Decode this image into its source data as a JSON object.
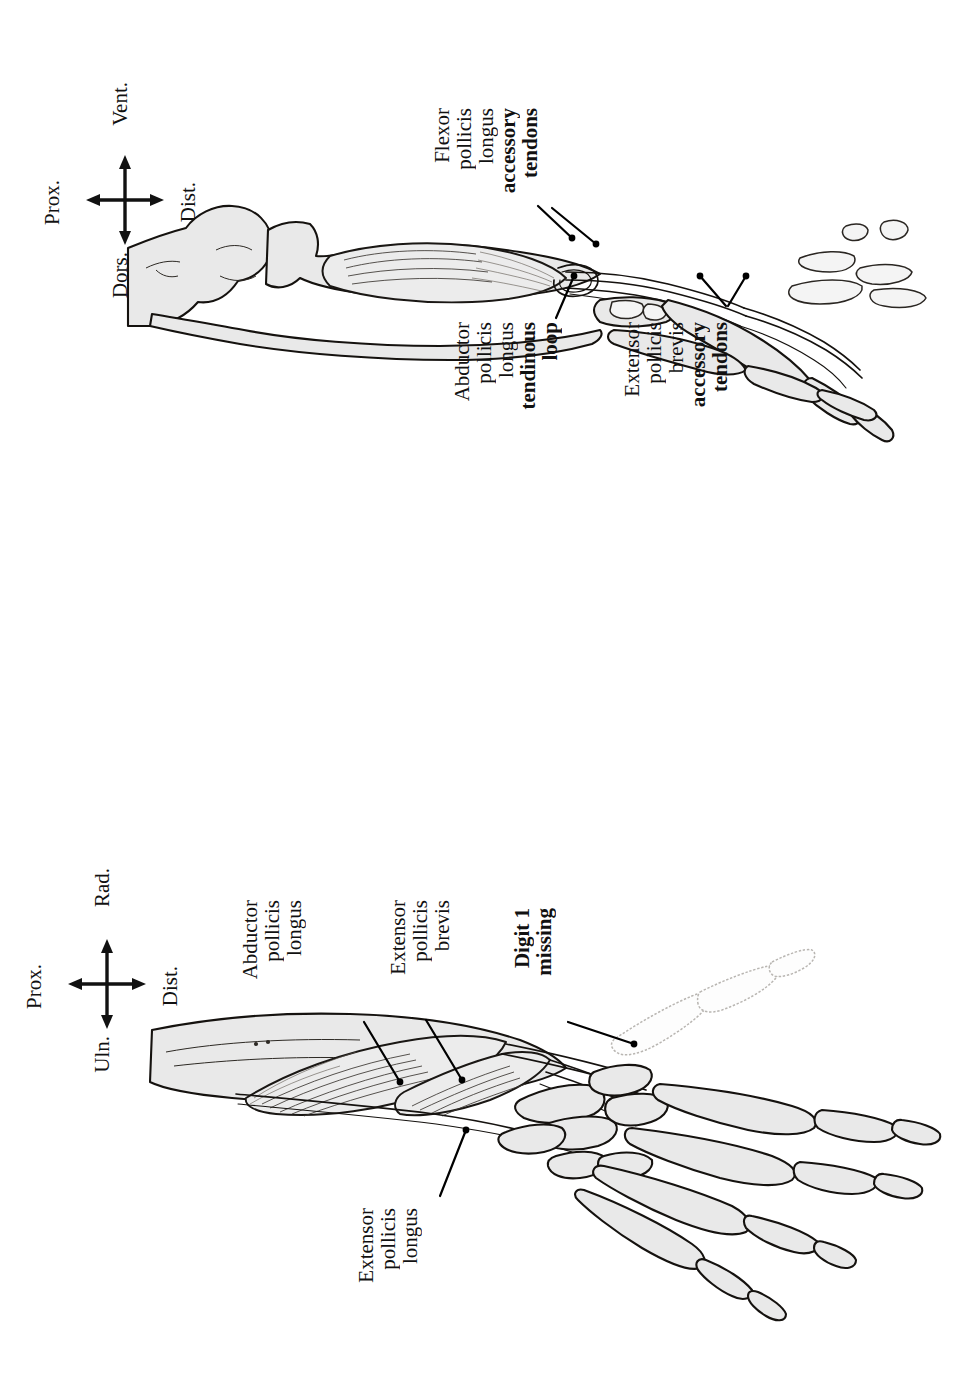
{
  "figure": {
    "type": "anatomical-line-drawing",
    "panels": [
      {
        "id": "ventral-view",
        "view_name": "ventral",
        "orientation_compass": {
          "up_label": "Vent.",
          "down_label": "Dors.",
          "left_label": "Prox.",
          "right_label": "Dist."
        },
        "labels": [
          {
            "id": "flexor-pollicis-longus-accessory-tendons",
            "lines": [
              "Flexor",
              "pollicis",
              "longus"
            ],
            "bold_lines": [
              "accessory",
              "tendons"
            ],
            "leader_count": 2
          },
          {
            "id": "abductor-pollicis-longus-tendinous-loop",
            "lines": [
              "Abductor",
              "pollicis",
              "longus"
            ],
            "bold_lines": [
              "tendinous",
              "loop"
            ],
            "leader_count": 1
          },
          {
            "id": "extensor-pollicis-brevis-accessory-tendons",
            "lines": [
              "Extensor",
              "pollicis",
              "brevis"
            ],
            "bold_lines": [
              "accessory",
              "tendons"
            ],
            "leader_count": 2
          }
        ]
      },
      {
        "id": "dorsal-view",
        "view_name": "dorsal",
        "orientation_compass": {
          "up_label": "Rad.",
          "down_label": "Uln.",
          "left_label": "Prox.",
          "right_label": "Dist."
        },
        "labels": [
          {
            "id": "abductor-pollicis-longus",
            "lines": [
              "Abductor",
              "pollicis",
              "longus"
            ],
            "bold_lines": [],
            "leader_count": 1
          },
          {
            "id": "extensor-pollicis-brevis",
            "lines": [
              "Extensor",
              "pollicis",
              "brevis"
            ],
            "bold_lines": [],
            "leader_count": 1
          },
          {
            "id": "digit-1-missing",
            "lines": [],
            "bold_lines": [
              "Digit 1",
              "missing"
            ],
            "leader_count": 1
          },
          {
            "id": "extensor-pollicis-longus",
            "lines": [
              "Extensor",
              "pollicis",
              "longus"
            ],
            "bold_lines": [],
            "leader_count": 1
          }
        ]
      }
    ]
  },
  "colors": {
    "page_background": "#ffffff",
    "ink": "#15120f",
    "bone_fill": "#e9e9e9",
    "ghost_outline": "#b9b6b2",
    "muscle_fill": "#ececec"
  }
}
